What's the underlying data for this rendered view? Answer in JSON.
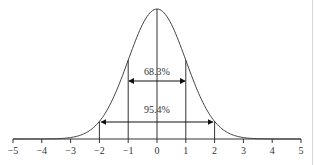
{
  "chart_data": {
    "type": "line",
    "title": "",
    "xlabel": "",
    "ylabel": "",
    "xlim": [
      -5,
      5
    ],
    "x_ticks": [
      "−5",
      "−4",
      "−3",
      "−2",
      "−1",
      "0",
      "1",
      "2",
      "3",
      "4",
      "5"
    ],
    "grid": false,
    "series": [
      {
        "name": "normal-pdf",
        "mean": 0,
        "sd": 1
      }
    ],
    "vertical_lines": [
      -2,
      -1,
      0,
      1,
      2
    ],
    "annotations": [
      {
        "label": "68.3%",
        "from": -1,
        "to": 1
      },
      {
        "label": "95.4%",
        "from": -2,
        "to": 2
      }
    ]
  },
  "labels": {
    "inner": "68.3%",
    "outer": "95.4%"
  }
}
